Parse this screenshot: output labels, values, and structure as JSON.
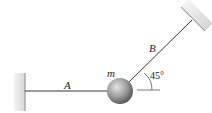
{
  "diagram": {
    "labels": {
      "rope_a": "A",
      "rope_b": "B",
      "mass": "m",
      "angle": "45°"
    },
    "colors": {
      "wall": "#e0e0e0",
      "wall_edge": "#9a9a9a",
      "rope": "#333333",
      "ball_light": "#d8d8d8",
      "ball_dark": "#5e5e5e"
    }
  }
}
